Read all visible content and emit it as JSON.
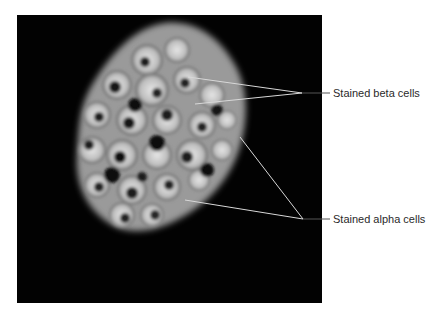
{
  "figure": {
    "background_color": "#020202",
    "line_color": "#d8d8d8",
    "labels": [
      {
        "id": "beta",
        "text": "Stained beta cells",
        "x": 333,
        "y": 87
      },
      {
        "id": "alpha",
        "text": "Stained alpha cells",
        "x": 333,
        "y": 213
      }
    ],
    "leaders": {
      "beta": {
        "junction": [
          302,
          93
        ],
        "end": [
          330,
          93
        ],
        "targets": [
          [
            188,
            77
          ],
          [
            195,
            104
          ]
        ]
      },
      "alpha": {
        "junction": [
          303,
          219
        ],
        "end": [
          330,
          219
        ],
        "targets": [
          [
            240,
            137
          ],
          [
            185,
            200
          ]
        ]
      }
    }
  }
}
